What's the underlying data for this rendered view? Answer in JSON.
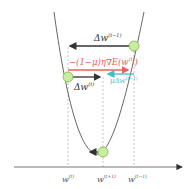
{
  "diagram": {
    "type": "momentum-gradient-descent",
    "labels": {
      "delta_prev": "Δw",
      "delta_prev_sup": "(t−1)",
      "gradient": "−(1−μ)η∇E(w",
      "gradient_sup": "(t)",
      "gradient_close": ")",
      "delta_curr": "Δw",
      "delta_curr_sup": "(t)",
      "momentum": "μΔw",
      "momentum_sup": "(t−1)"
    },
    "axis_ticks": [
      {
        "base": "w",
        "sup": "(t)"
      },
      {
        "base": "w",
        "sup": "(t+1)"
      },
      {
        "base": "w",
        "sup": "(t−1)"
      }
    ],
    "colors": {
      "curve": "#555555",
      "arrow_dark": "#333333",
      "gradient": "#e8605a",
      "momentum": "#3cc0c8",
      "ball_fill": "#c8eca0",
      "ball_stroke": "#7cb84a",
      "dashed": "#aaaaaa"
    }
  }
}
